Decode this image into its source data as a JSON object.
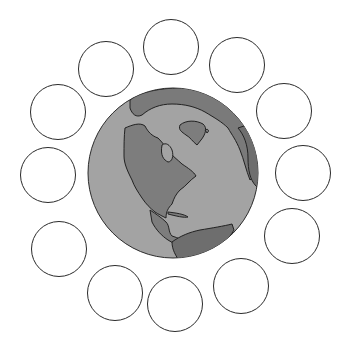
{
  "colors": {
    "ocean": "#a3a3a3",
    "land": "#7d7d7d",
    "land_dark": "#6a6a6a",
    "outline": "#2b2b2b",
    "background": "#ffffff"
  },
  "globe": {
    "cx": 173,
    "cy": 173,
    "r": 85,
    "depicts": "Earth - North America, Greenland, Europe, South America"
  },
  "circles": [
    {
      "cx": 171,
      "cy": 47,
      "r": 28
    },
    {
      "cx": 237,
      "cy": 65,
      "r": 28
    },
    {
      "cx": 284,
      "cy": 111,
      "r": 28
    },
    {
      "cx": 303,
      "cy": 173,
      "r": 28
    },
    {
      "cx": 292,
      "cy": 236,
      "r": 28
    },
    {
      "cx": 241,
      "cy": 286,
      "r": 28
    },
    {
      "cx": 175,
      "cy": 304,
      "r": 28
    },
    {
      "cx": 115,
      "cy": 293,
      "r": 28
    },
    {
      "cx": 59,
      "cy": 249,
      "r": 28
    },
    {
      "cx": 48,
      "cy": 175,
      "r": 28
    },
    {
      "cx": 58,
      "cy": 112,
      "r": 28
    },
    {
      "cx": 106,
      "cy": 69,
      "r": 28
    }
  ]
}
